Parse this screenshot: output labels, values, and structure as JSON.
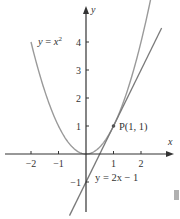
{
  "chart_data": {
    "type": "line",
    "title": "",
    "xlabel": "x",
    "ylabel": "y",
    "xlim": [
      -2.9,
      2.9
    ],
    "ylim": [
      -2.3,
      5.5
    ],
    "grid": false,
    "x_ticks": [
      {
        "value": -2,
        "label": "−2"
      },
      {
        "value": -1,
        "label": "−1"
      },
      {
        "value": 1,
        "label": "1"
      },
      {
        "value": 2,
        "label": "2"
      }
    ],
    "y_ticks": [
      {
        "value": -1,
        "label": "−1"
      },
      {
        "value": 1,
        "label": "1"
      },
      {
        "value": 2,
        "label": "2"
      },
      {
        "value": 3,
        "label": "3"
      },
      {
        "value": 4,
        "label": "4"
      }
    ],
    "series": [
      {
        "name": "parabola",
        "label": "y = x²",
        "function": "x^2",
        "x_range": [
          -2.0,
          2.35
        ],
        "color": "#9a9a9a"
      },
      {
        "name": "tangent-line",
        "label": "y = 2x − 1",
        "function": "2x-1",
        "x_range": [
          -0.6,
          2.75
        ],
        "color": "#7a7a7a"
      }
    ],
    "points": [
      {
        "name": "P",
        "label": "P(1, 1)",
        "x": 1,
        "y": 1
      }
    ],
    "annotations": {
      "parabola_label": "y = x²",
      "tangent_label": "y = 2x − 1",
      "point_label": "P(1, 1)"
    },
    "legend": "none"
  }
}
